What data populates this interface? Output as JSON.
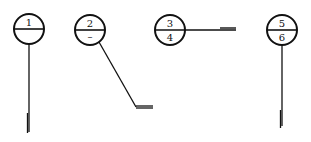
{
  "colors": {
    "stroke": "#111111",
    "background": "#ffffff"
  },
  "symbols": [
    {
      "id": "symbol-1",
      "top": "1",
      "bottom": "",
      "cx": 29,
      "cy": 29,
      "r": 15,
      "leader": {
        "type": "vertical",
        "points": [
          [
            29,
            44
          ],
          [
            29,
            132
          ]
        ],
        "tick": {
          "x": 28,
          "y1": 113,
          "y2": 133,
          "double": true
        }
      }
    },
    {
      "id": "symbol-2",
      "top": "2",
      "bottom": "–",
      "cx": 90,
      "cy": 30,
      "r": 15,
      "leader": {
        "type": "diagonal",
        "points": [
          [
            99,
            42
          ],
          [
            136,
            107
          ]
        ],
        "tail": {
          "x1": 136,
          "x2": 153,
          "y": 107,
          "double": true
        }
      }
    },
    {
      "id": "symbol-3",
      "top": "3",
      "bottom": "4",
      "cx": 170,
      "cy": 30,
      "r": 15,
      "leader": {
        "type": "horizontal",
        "points": [
          [
            185,
            30
          ],
          [
            236,
            30
          ]
        ],
        "tail": {
          "x1": 220,
          "x2": 236,
          "y": 28,
          "double": true
        }
      }
    },
    {
      "id": "symbol-4",
      "top": "5",
      "bottom": "6",
      "cx": 282,
      "cy": 30,
      "r": 15,
      "leader": {
        "type": "vertical",
        "points": [
          [
            282,
            45
          ],
          [
            282,
            126
          ]
        ],
        "tick": {
          "x": 281,
          "y1": 110,
          "y2": 128,
          "double": true
        }
      }
    }
  ]
}
